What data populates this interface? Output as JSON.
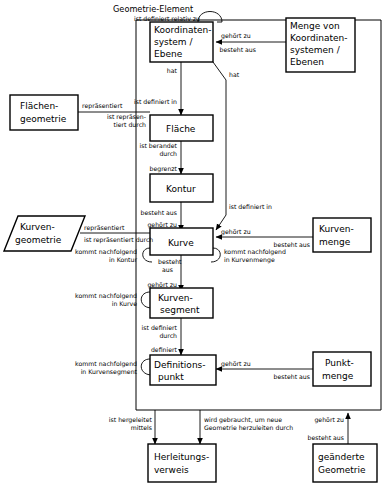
{
  "diagram": {
    "frame_label": "Geometrie-Element",
    "entities": [
      {
        "id": "koordinatensystem",
        "lines": [
          "Koordinaten-",
          "system /",
          "Ebene"
        ],
        "shape": "rect"
      },
      {
        "id": "menge_koordinatensysteme",
        "lines": [
          "Menge von",
          "Koordinaten-",
          "systemen /",
          "Ebenen"
        ],
        "shape": "rect"
      },
      {
        "id": "flaechengeometrie",
        "lines": [
          "Flächen-",
          "geometrie"
        ],
        "shape": "rect"
      },
      {
        "id": "flaeche",
        "lines": [
          "Fläche"
        ],
        "shape": "rect"
      },
      {
        "id": "kontur",
        "lines": [
          "Kontur"
        ],
        "shape": "rect"
      },
      {
        "id": "kurvengeometrie",
        "lines": [
          "Kurven-",
          "geometrie"
        ],
        "shape": "parallelogram"
      },
      {
        "id": "kurve",
        "lines": [
          "Kurve"
        ],
        "shape": "rect"
      },
      {
        "id": "kurvenmenge",
        "lines": [
          "Kurven-",
          "menge"
        ],
        "shape": "rect"
      },
      {
        "id": "kurvensegment",
        "lines": [
          "Kurven-",
          "segment"
        ],
        "shape": "rect"
      },
      {
        "id": "definitionspunkt",
        "lines": [
          "Definitions-",
          "punkt"
        ],
        "shape": "rect"
      },
      {
        "id": "punktmenge",
        "lines": [
          "Punkt-",
          "menge"
        ],
        "shape": "rect"
      },
      {
        "id": "herleitungsverweis",
        "lines": [
          "Herleitungs-",
          "verweis"
        ],
        "shape": "rect"
      },
      {
        "id": "geaenderte_geometrie",
        "lines": [
          "geänderte",
          "Geometrie"
        ],
        "shape": "rect"
      }
    ],
    "edge_labels": [
      {
        "id": "ist-definiert-relativ-zu",
        "lines": [
          "ist definiert relativ zu"
        ]
      },
      {
        "id": "gehoert-zu-ks",
        "lines": [
          "gehört zu"
        ]
      },
      {
        "id": "besteht-aus-ks",
        "lines": [
          "besteht aus"
        ]
      },
      {
        "id": "hat-flaeche",
        "lines": [
          "hat"
        ]
      },
      {
        "id": "hat-kurve",
        "lines": [
          "hat"
        ]
      },
      {
        "id": "ist-definiert-in-flaeche",
        "lines": [
          "ist definiert in"
        ]
      },
      {
        "id": "repraesentiert-flaeche",
        "lines": [
          "repräsentiert"
        ]
      },
      {
        "id": "ist-repraesentiert-durch-flaeche",
        "lines": [
          "ist repräsen-",
          "tiert durch"
        ]
      },
      {
        "id": "ist-berandet-durch",
        "lines": [
          "ist berandet",
          "durch"
        ]
      },
      {
        "id": "begrenzt",
        "lines": [
          "begrenzt"
        ]
      },
      {
        "id": "besteht-aus-kontur",
        "lines": [
          "besteht aus"
        ]
      },
      {
        "id": "gehoert-zu-kurve",
        "lines": [
          "gehört zu"
        ]
      },
      {
        "id": "ist-definiert-in-kurve",
        "lines": [
          "ist definiert in"
        ]
      },
      {
        "id": "repraesentiert-kurve",
        "lines": [
          "repräsentiert"
        ]
      },
      {
        "id": "ist-repraesentiert-durch-kurve",
        "lines": [
          "ist repräsentiert durch"
        ]
      },
      {
        "id": "gehoert-zu-kurvenmenge",
        "lines": [
          "gehört zu"
        ]
      },
      {
        "id": "besteht-aus-kurvenmenge",
        "lines": [
          "besteht aus"
        ]
      },
      {
        "id": "kommt-nachfolgend-in-kontur",
        "lines": [
          "kommt nachfolgend",
          "in Kontur"
        ]
      },
      {
        "id": "kommt-nachfolgend-in-kurvenmenge",
        "lines": [
          "kommt nachfolgend",
          "in Kurvenmenge"
        ]
      },
      {
        "id": "besteht-aus-kurve",
        "lines": [
          "besteht",
          "aus"
        ]
      },
      {
        "id": "gehoert-zu-kurvensegment",
        "lines": [
          "gehört zu"
        ]
      },
      {
        "id": "kommt-nachfolgend-in-kurve",
        "lines": [
          "kommt nachfolgend",
          "in Kurve"
        ]
      },
      {
        "id": "ist-definiert-durch",
        "lines": [
          "ist definiert",
          "durch"
        ]
      },
      {
        "id": "definiert",
        "lines": [
          "definiert"
        ]
      },
      {
        "id": "kommt-nachfolgend-in-kurvensegment",
        "lines": [
          "kommt nachfolgend",
          "in Kurvensegment"
        ]
      },
      {
        "id": "gehoert-zu-punktmenge",
        "lines": [
          "gehört zu"
        ]
      },
      {
        "id": "besteht-aus-punktmenge",
        "lines": [
          "besteht aus"
        ]
      },
      {
        "id": "ist-hergeleitet-mittels",
        "lines": [
          "ist hergeleitet",
          "mittels"
        ]
      },
      {
        "id": "wird-gebraucht",
        "lines": [
          "wird gebraucht, um neue",
          "Geometrie herzuleiten durch"
        ]
      },
      {
        "id": "gehoert-zu-geaenderte",
        "lines": [
          "gehört zu"
        ]
      },
      {
        "id": "besteht-aus-geaenderte",
        "lines": [
          "besteht aus"
        ]
      }
    ]
  }
}
